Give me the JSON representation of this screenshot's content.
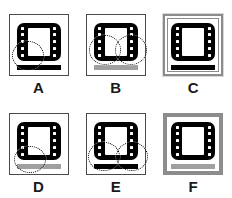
{
  "figure": {
    "title": "",
    "layout": {
      "rows": 2,
      "columns": 3
    },
    "colors": {
      "icon_fill": "#000000",
      "icon_screen": "#ffffff",
      "bar_black": "#000000",
      "bar_gray": "#a0a0a0",
      "frame_thin": "#4a4a4a",
      "frame_gray": "#8c8c8c",
      "annotation": "#1a1a1a",
      "background": "#ffffff"
    },
    "panels": [
      {
        "id": "A",
        "label": "A",
        "frame": "thin",
        "icon": "film-strip-icon",
        "sprockets_per_side": 5,
        "bar": {
          "color": "black",
          "label": "progress-bar"
        },
        "annotations": [
          {
            "shape": "dotted-circle",
            "position": "bottom-left"
          }
        ],
        "annotation_count": 1
      },
      {
        "id": "B",
        "label": "B",
        "frame": "thin",
        "icon": "film-strip-icon",
        "sprockets_per_side": 5,
        "bar": {
          "color": "gray",
          "label": "progress-bar"
        },
        "annotations": [
          {
            "shape": "dotted-circle",
            "position": "left"
          },
          {
            "shape": "dotted-circle",
            "position": "right"
          }
        ],
        "annotation_count": 2
      },
      {
        "id": "C",
        "label": "C",
        "frame": "double-gray",
        "icon": "film-strip-icon",
        "sprockets_per_side": 5,
        "bar": {
          "color": "black",
          "label": "progress-bar"
        },
        "annotations": [],
        "annotation_count": 0
      },
      {
        "id": "D",
        "label": "D",
        "frame": "thin",
        "icon": "film-strip-icon",
        "sprockets_per_side": 5,
        "bar": {
          "color": "gray",
          "label": "progress-bar"
        },
        "annotations": [
          {
            "shape": "dotted-circle",
            "position": "bottom-left"
          }
        ],
        "annotation_count": 1
      },
      {
        "id": "E",
        "label": "E",
        "frame": "thin",
        "icon": "film-strip-icon",
        "sprockets_per_side": 5,
        "bar": {
          "color": "black",
          "label": "progress-bar"
        },
        "annotations": [
          {
            "shape": "dotted-circle",
            "position": "bottom-left"
          },
          {
            "shape": "dotted-circle",
            "position": "bottom-right"
          }
        ],
        "annotation_count": 2
      },
      {
        "id": "F",
        "label": "F",
        "frame": "thick-gray",
        "icon": "film-strip-icon",
        "sprockets_per_side": 5,
        "bar": {
          "color": "gray",
          "label": "progress-bar"
        },
        "annotations": [],
        "annotation_count": 0
      }
    ]
  }
}
